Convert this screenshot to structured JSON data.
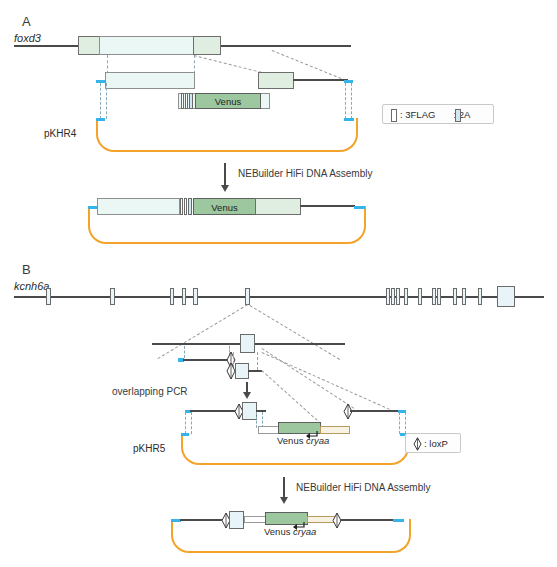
{
  "figure": {
    "panels": [
      {
        "id": "A",
        "letter": "A",
        "gene": "foxd3",
        "plasmid": "pKHR4",
        "step": "NEBuilder HiFi DNA Assembly",
        "reporter": "Venus"
      },
      {
        "id": "B",
        "letter": "B",
        "gene": "kcnh6a",
        "plasmid": "pKHR5",
        "step_pcr": "overlapping PCR",
        "step": "NEBuilder HiFi DNA Assembly",
        "reporter": "Venus",
        "marker": "cryaa"
      }
    ],
    "legend_a": {
      "items": [
        {
          "symbol": "3flag-box",
          "label": ": 3FLAG"
        },
        {
          "symbol": "2a-box",
          "label": ": 2A"
        }
      ]
    },
    "legend_b": {
      "items": [
        {
          "symbol": "loxp-arrow",
          "label": ": loxP"
        }
      ]
    },
    "colors": {
      "plasmid_backbone": "#f3a32a",
      "homology_arm": "#34b4e8",
      "venus_fill": "#9dc79f",
      "exon_fill": "#dff0ec",
      "2a_fill": "#cfe7f2",
      "dna_line": "#4a4a4a",
      "cryaa_fill": "#f7f2e2"
    }
  }
}
